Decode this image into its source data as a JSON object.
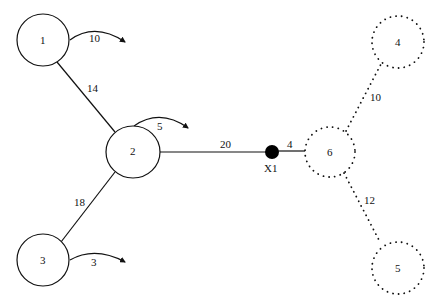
{
  "diagram": {
    "type": "network-graph",
    "colors": {
      "stroke": "#111111",
      "background": "#ffffff",
      "junction_fill": "#000000"
    },
    "nodes": [
      {
        "id": "1",
        "label": "1",
        "style": "solid",
        "cx": 43,
        "cy": 40,
        "r": 26
      },
      {
        "id": "2",
        "label": "2",
        "style": "solid",
        "cx": 133,
        "cy": 152,
        "rx": 27,
        "ry": 26
      },
      {
        "id": "3",
        "label": "3",
        "style": "solid",
        "cx": 43,
        "cy": 260,
        "r": 26
      },
      {
        "id": "6",
        "label": "6",
        "style": "dotted",
        "cx": 330,
        "cy": 152,
        "r": 25
      },
      {
        "id": "4",
        "label": "4",
        "style": "dotted",
        "cx": 398,
        "cy": 42,
        "r": 26
      },
      {
        "id": "5",
        "label": "5",
        "style": "dotted",
        "cx": 398,
        "cy": 268,
        "r": 26
      }
    ],
    "junction": {
      "id": "X1",
      "label": "X1",
      "cx": 272,
      "cy": 152,
      "r": 7
    },
    "edges": [
      {
        "from": "1",
        "to": "2",
        "label": "14",
        "style": "solid"
      },
      {
        "from": "3",
        "to": "2",
        "label": "18",
        "style": "solid"
      },
      {
        "from": "2",
        "to": "X1",
        "label": "20",
        "style": "solid"
      },
      {
        "from": "X1",
        "to": "6",
        "label": "4",
        "style": "solid"
      },
      {
        "from": "6",
        "to": "4",
        "label": "10",
        "style": "dotted"
      },
      {
        "from": "6",
        "to": "5",
        "label": "12",
        "style": "dotted"
      }
    ],
    "self_arrows": [
      {
        "node": "1",
        "label": "10"
      },
      {
        "node": "2",
        "label": "5"
      },
      {
        "node": "3",
        "label": "3"
      }
    ]
  }
}
